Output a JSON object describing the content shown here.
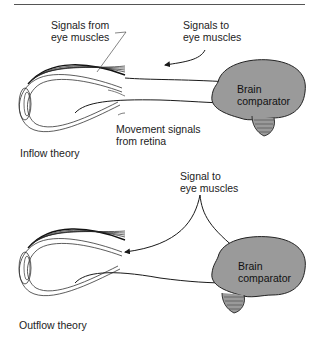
{
  "diagram": {
    "panels": [
      {
        "title": "Inflow theory",
        "labels": {
          "signals_from_line1": "Signals from",
          "signals_from_line2": "eye muscles",
          "signals_to_line1": "Signals to",
          "signals_to_line2": "eye muscles",
          "movement_line1": "Movement signals",
          "movement_line2": "from retina",
          "brain_line1": "Brain",
          "brain_line2": "comparator"
        }
      },
      {
        "title": "Outflow theory",
        "labels": {
          "signal_to_line1": "Signal to",
          "signal_to_line2": "eye muscles",
          "brain_line1": "Brain",
          "brain_line2": "comparator"
        }
      }
    ],
    "colors": {
      "brain_fill": "#9a9a9a",
      "line": "#1a1a1a"
    }
  }
}
